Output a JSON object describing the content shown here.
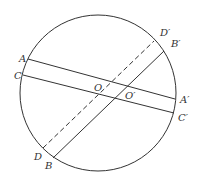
{
  "diagram": {
    "type": "geometry",
    "colors": {
      "stroke": "#333333",
      "background": "#ffffff"
    },
    "circle": {
      "cx": 98,
      "cy": 93,
      "r": 78
    },
    "lines": [
      {
        "id": "AA'",
        "x1": 28,
        "y1": 59,
        "x2": 175,
        "y2": 99,
        "style": "solid"
      },
      {
        "id": "CC'",
        "x1": 23,
        "y1": 75,
        "x2": 174,
        "y2": 113,
        "style": "solid"
      },
      {
        "id": "DD'",
        "x1": 43,
        "y1": 148,
        "x2": 154,
        "y2": 41,
        "style": "dashed"
      },
      {
        "id": "BB'",
        "x1": 53,
        "y1": 158,
        "x2": 164,
        "y2": 51,
        "style": "solid"
      }
    ],
    "labels": [
      {
        "text": "A",
        "x": 19,
        "y": 62
      },
      {
        "text": "C",
        "x": 14,
        "y": 79
      },
      {
        "text": "D′",
        "x": 160,
        "y": 36
      },
      {
        "text": "B′",
        "x": 171,
        "y": 47
      },
      {
        "text": "O",
        "x": 94,
        "y": 91
      },
      {
        "text": "O′",
        "x": 125,
        "y": 99
      },
      {
        "text": "A′",
        "x": 180,
        "y": 103
      },
      {
        "text": "C′",
        "x": 178,
        "y": 121
      },
      {
        "text": "D",
        "x": 34,
        "y": 160
      },
      {
        "text": "B",
        "x": 45,
        "y": 169
      }
    ]
  }
}
